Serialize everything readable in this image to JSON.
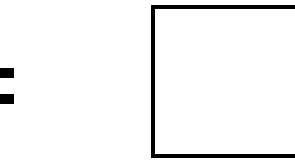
{
  "diagram": {
    "shapes": [
      {
        "type": "equals-sign",
        "color": "#000000"
      },
      {
        "type": "rectangle-outline",
        "color": "#000000",
        "fill": "#ffffff"
      }
    ]
  }
}
